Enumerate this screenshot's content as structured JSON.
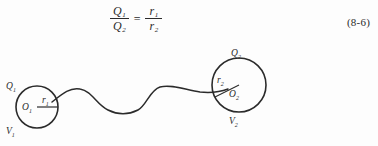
{
  "equation": {
    "left": {
      "numerator": "Q",
      "numerator_sub": "1",
      "denominator": "Q",
      "denominator_sub": "2"
    },
    "operator": "=",
    "right": {
      "numerator": "r",
      "numerator_sub": "1",
      "denominator": "r",
      "denominator_sub": "2"
    },
    "number": "(8-6)"
  },
  "figure": {
    "sphere_left": {
      "charge_label": "Q",
      "charge_sub": "1",
      "center_label": "O",
      "center_sub": "1",
      "radius_label": "r",
      "radius_sub": "1",
      "potential_label": "V",
      "potential_sub": "1"
    },
    "sphere_right": {
      "charge_label": "Q",
      "charge_sub": "2",
      "center_label": "O",
      "center_sub": "2",
      "radius_label": "r",
      "radius_sub": "2",
      "potential_label": "V",
      "potential_sub": "2"
    }
  },
  "style": {
    "ink": "#2b2b2b",
    "paper": "#fdfdfd"
  }
}
